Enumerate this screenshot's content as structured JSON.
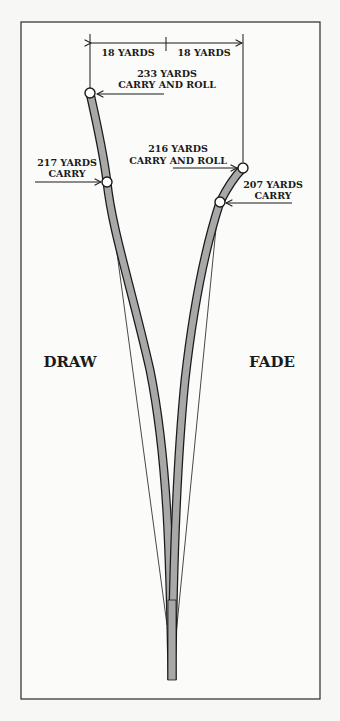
{
  "diagram": {
    "colors": {
      "path_fill": "#a8a8a8",
      "outline": "#1a1a1a",
      "background": "#f7f7f5",
      "frame": "#2a2a2a"
    },
    "dimension": {
      "left_label": "18 YARDS",
      "right_label": "18 YARDS"
    },
    "draw": {
      "label": "DRAW",
      "final": {
        "line1": "233 YARDS",
        "line2": "CARRY AND ROLL"
      },
      "carry": {
        "line1": "217 YARDS",
        "line2": "CARRY"
      }
    },
    "fade": {
      "label": "FADE",
      "final": {
        "line1": "216 YARDS",
        "line2": "CARRY AND ROLL"
      },
      "carry": {
        "line1": "207 YARDS",
        "line2": "CARRY"
      }
    }
  }
}
